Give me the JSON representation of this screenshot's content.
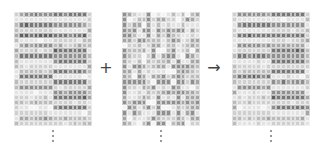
{
  "diagram": {
    "rows": 22,
    "cols": 16,
    "operators": {
      "plus": "+",
      "arrow": "→"
    },
    "ellipsis": "⋮",
    "palette": [
      "#f4f4f4",
      "#e2e2e2",
      "#cfcfcf",
      "#bbbbbb",
      "#a6a6a6",
      "#8f8f8f",
      "#777777",
      "#5f5f5f"
    ],
    "left_bands": [
      [
        5,
        6
      ],
      [
        1,
        1
      ],
      [
        6,
        5
      ],
      [
        2,
        1
      ],
      [
        7,
        6
      ],
      [
        1,
        2
      ],
      [
        5,
        3
      ],
      [
        2,
        6
      ],
      [
        6,
        5
      ],
      [
        1,
        6
      ],
      [
        2,
        1
      ],
      [
        3,
        6
      ],
      [
        6,
        1
      ],
      [
        2,
        6
      ],
      [
        5,
        2
      ],
      [
        1,
        5
      ],
      [
        2,
        6
      ],
      [
        3,
        2
      ],
      [
        1,
        6
      ],
      [
        2,
        1
      ],
      [
        4,
        3
      ],
      [
        2,
        2
      ]
    ],
    "right_bands": [
      [
        5,
        6
      ],
      [
        1,
        1
      ],
      [
        6,
        5
      ],
      [
        1,
        2
      ],
      [
        6,
        6
      ],
      [
        1,
        2
      ],
      [
        5,
        4
      ],
      [
        2,
        6
      ],
      [
        6,
        5
      ],
      [
        1,
        6
      ],
      [
        2,
        2
      ],
      [
        3,
        6
      ],
      [
        6,
        1
      ],
      [
        2,
        5
      ],
      [
        5,
        1
      ],
      [
        1,
        5
      ],
      [
        2,
        6
      ],
      [
        2,
        2
      ],
      [
        1,
        6
      ],
      [
        2,
        1
      ],
      [
        3,
        3
      ],
      [
        1,
        2
      ]
    ]
  },
  "labels": {
    "plus": "+",
    "arrow": "→"
  }
}
